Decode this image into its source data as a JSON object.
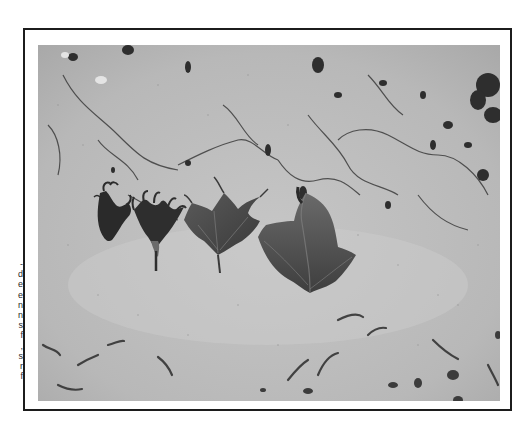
{
  "page": {
    "type": "scanned-document-page",
    "background_color": "#ffffff",
    "frame_color": "#1c1c1c"
  },
  "text_fragment": {
    "description": "truncated line endings of adjacent text column",
    "lines": [
      "-",
      "d",
      "e",
      "e",
      "n",
      "n",
      "s",
      "f",
      ",",
      "s",
      "r",
      "f"
    ]
  },
  "figure": {
    "kind": "black-and-white photograph",
    "leaves": [
      {
        "index": 1,
        "description": "small, highly curled and distorted dark leaf"
      },
      {
        "index": 2,
        "description": "distorted leaf with curled tendril-like lobes and visible petiole"
      },
      {
        "index": 3,
        "description": "lobed leaf with wavy, slightly curled margins"
      },
      {
        "index": 4,
        "description": "largest, normal-looking broad lobed leaf"
      }
    ],
    "colors": {
      "soil": "#b9b9b9",
      "soil_light": "#cfcfcf",
      "cracks": "#3a3a3a",
      "leaf_dark": "#2b2b2b",
      "leaf_mid": "#555555"
    }
  }
}
